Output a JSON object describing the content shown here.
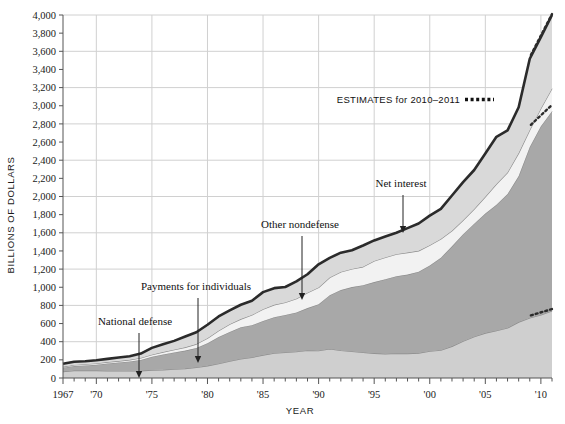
{
  "chart_data": {
    "type": "area",
    "title": "",
    "subtitle": "",
    "xlabel": "YEAR",
    "ylabel": "BILLIONS OF DOLLARS",
    "xlim": [
      1967,
      2011
    ],
    "ylim": [
      0,
      4000
    ],
    "ytick_step": 200,
    "grid": "horizontal every 400, vertical every 5 years",
    "legend_position": "inline annotations with arrows",
    "ytick_labels": [
      "0",
      "200",
      "400",
      "600",
      "800",
      "1,000",
      "1,200",
      "1,400",
      "1,600",
      "1,800",
      "2,000",
      "2,200",
      "2,400",
      "2,600",
      "2,800",
      "3,000",
      "3,200",
      "3,400",
      "3,600",
      "3,800",
      "4,000"
    ],
    "xtick_labels": [
      "1967",
      "'70",
      "'75",
      "'80",
      "'85",
      "'90",
      "'95",
      "'00",
      "'05",
      "'10"
    ],
    "xtick_values": [
      1967,
      1970,
      1975,
      1980,
      1985,
      1990,
      1995,
      2000,
      2005,
      2010
    ],
    "x": [
      1967,
      1968,
      1969,
      1970,
      1971,
      1972,
      1973,
      1974,
      1975,
      1976,
      1977,
      1978,
      1979,
      1980,
      1981,
      1982,
      1983,
      1984,
      1985,
      1986,
      1987,
      1988,
      1989,
      1990,
      1991,
      1992,
      1993,
      1994,
      1995,
      1996,
      1997,
      1998,
      1999,
      2000,
      2001,
      2002,
      2003,
      2004,
      2005,
      2006,
      2007,
      2008,
      2009,
      2010,
      2011
    ],
    "series": [
      {
        "name": "National defense",
        "color": "#cfcfcf",
        "values": [
          71,
          82,
          82,
          82,
          79,
          79,
          77,
          79,
          87,
          90,
          97,
          104,
          116,
          134,
          158,
          185,
          210,
          227,
          253,
          273,
          282,
          290,
          304,
          300,
          320,
          303,
          292,
          282,
          272,
          266,
          271,
          269,
          275,
          295,
          306,
          349,
          405,
          455,
          495,
          522,
          551,
          616,
          661,
          694,
          740
        ]
      },
      {
        "name": "Payments for individuals",
        "color": "#a8a8a8",
        "values": [
          42,
          50,
          57,
          65,
          81,
          92,
          105,
          120,
          147,
          169,
          185,
          198,
          215,
          250,
          294,
          322,
          349,
          355,
          375,
          397,
          412,
          432,
          466,
          513,
          593,
          666,
          710,
          740,
          785,
          822,
          850,
          871,
          896,
          944,
          1020,
          1103,
          1180,
          1246,
          1318,
          1388,
          1476,
          1609,
          1885,
          2080,
          2200
        ]
      },
      {
        "name": "Net interest",
        "color": "#f2f2f2",
        "values": [
          10,
          11,
          13,
          14,
          15,
          16,
          18,
          22,
          23,
          27,
          30,
          36,
          43,
          53,
          69,
          85,
          90,
          112,
          130,
          136,
          139,
          152,
          169,
          184,
          195,
          200,
          199,
          203,
          232,
          241,
          244,
          242,
          230,
          223,
          206,
          171,
          153,
          160,
          184,
          227,
          237,
          253,
          187,
          196,
          250
        ]
      },
      {
        "name": "Other nondefense",
        "color": "#d9d9d9",
        "values": [
          34,
          36,
          32,
          35,
          36,
          39,
          40,
          48,
          75,
          85,
          97,
          120,
          130,
          150,
          157,
          154,
          158,
          158,
          188,
          184,
          170,
          190,
          204,
          256,
          216,
          212,
          207,
          235,
          227,
          231,
          236,
          270,
          301,
          327,
          331,
          388,
          420,
          431,
          476,
          521,
          464,
          505,
          785,
          786,
          810
        ]
      }
    ],
    "total_top_values": [
      157,
      179,
      184,
      196,
      211,
      226,
      240,
      269,
      332,
      371,
      409,
      458,
      504,
      587,
      678,
      746,
      807,
      852,
      946,
      990,
      1003,
      1064,
      1143,
      1253,
      1324,
      1381,
      1408,
      1460,
      1516,
      1560,
      1601,
      1652,
      1702,
      1789,
      1863,
      2011,
      2158,
      2292,
      2473,
      2658,
      2728,
      2983,
      3518,
      3756,
      4000
    ],
    "annotations": [
      {
        "text": "National defense",
        "x_pct": 0.143,
        "y_pct": 0.24
      },
      {
        "text": "Payments for individuals",
        "x_pct": 0.268,
        "y_pct": 0.39
      },
      {
        "text": "Other nondefense",
        "x_pct": 0.438,
        "y_pct": 0.565
      },
      {
        "text": "Net interest",
        "x_pct": 0.615,
        "y_pct": 0.69
      },
      {
        "text": "ESTIMATES for 2010–2011",
        "x_pct": 0.74,
        "y_pct": 0.785
      }
    ],
    "estimate_note": "ESTIMATES for 2010–2011",
    "estimate_years": [
      2010,
      2011
    ],
    "estimate_marker": "dotted"
  },
  "axes": {
    "y_title": "BILLIONS OF DOLLARS",
    "x_title": "YEAR"
  },
  "annotations": {
    "national_defense": "National defense",
    "payments_for_individuals": "Payments for individuals",
    "other_nondefense": "Other nondefense",
    "net_interest": "Net interest",
    "estimates": "ESTIMATES for 2010–2011"
  },
  "colors": {
    "national_defense": "#cfcfcf",
    "payments_for_individuals": "#a8a8a8",
    "net_interest": "#f2f2f2",
    "other_nondefense": "#d9d9d9",
    "top_line": "#2b2b2b",
    "grid": "#d0d0d0",
    "axis": "#555555",
    "text": "#111111"
  }
}
